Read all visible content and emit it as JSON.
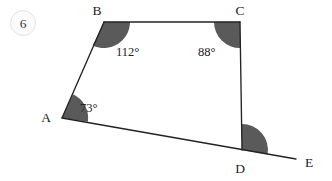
{
  "page": {
    "background_color": "#ffffff",
    "width": 332,
    "height": 181
  },
  "question": {
    "number": "6",
    "badge_shape": "circle"
  },
  "figure": {
    "type": "geometry-diagram",
    "shape": "quadrilateral-with-extended-side",
    "line_color": "#232323",
    "angle_fill_color": "#5a5a5a",
    "vertices": [
      {
        "id": "A",
        "label": "A",
        "x": 62,
        "y": 118,
        "label_x": 46,
        "label_y": 122
      },
      {
        "id": "B",
        "label": "B",
        "x": 104,
        "y": 22,
        "label_x": 95,
        "label_y": 17
      },
      {
        "id": "C",
        "label": "C",
        "x": 240,
        "y": 22,
        "label_x": 236,
        "label_y": 17
      },
      {
        "id": "D",
        "label": "D",
        "x": 242,
        "y": 150,
        "label_x": 236,
        "label_y": 170
      },
      {
        "id": "E",
        "label": "E",
        "x": 296,
        "y": 159,
        "label_x": 305,
        "label_y": 166
      }
    ],
    "edges": [
      {
        "id": "AB",
        "from": "A",
        "to": "B"
      },
      {
        "id": "BC",
        "from": "B",
        "to": "C"
      },
      {
        "id": "CD",
        "from": "C",
        "to": "D"
      },
      {
        "id": "AE",
        "from": "A",
        "to": "E",
        "note": "side AD extended through D to E"
      }
    ],
    "angles": [
      {
        "id": "angle-B",
        "vertex": "B",
        "value": "112°",
        "label_x": 116,
        "label_y": 52,
        "shaded": true
      },
      {
        "id": "angle-C",
        "vertex": "C",
        "value": "88°",
        "label_x": 199,
        "label_y": 52,
        "shaded": true
      },
      {
        "id": "angle-A",
        "vertex": "A",
        "value": "73°",
        "label_x": 80,
        "label_y": 108,
        "shaded": true
      },
      {
        "id": "angle-D",
        "vertex": "D",
        "value": "",
        "label_x": 0,
        "label_y": 0,
        "shaded": true,
        "note": "exterior angle CDE, unlabeled"
      }
    ]
  }
}
